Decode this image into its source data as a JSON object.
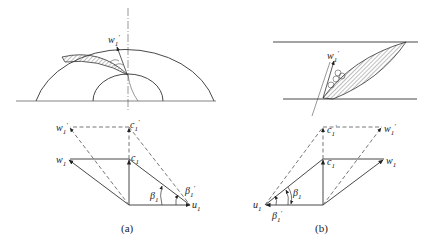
{
  "figure": {
    "panels": [
      {
        "id": "a",
        "caption": "(a)",
        "top_view": "Centrifugal impeller inlet (meridional half-disc) with blade and relative velocity arrow",
        "blade_label": {
          "sym": "w",
          "sub": "1",
          "sup": "′"
        },
        "labels": {
          "w1_prime": {
            "sym": "w",
            "sub": "1",
            "sup": "′"
          },
          "c1_prime": {
            "sym": "c",
            "sub": "1",
            "sup": "′"
          },
          "w1": {
            "sym": "w",
            "sub": "1"
          },
          "c1": {
            "sym": "c",
            "sub": "1"
          },
          "beta1": {
            "sym": "β",
            "sub": "1"
          },
          "beta1_prime": {
            "sym": "β",
            "sub": "1",
            "sup": "′"
          },
          "u1": {
            "sym": "u",
            "sub": "1"
          }
        }
      },
      {
        "id": "b",
        "caption": "(b)",
        "top_view": "Axial cascade blade between two parallel lines with relative velocity arrow",
        "blade_label": {
          "sym": "w",
          "sub": "1",
          "sup": "′"
        },
        "labels": {
          "c1_prime": {
            "sym": "c",
            "sub": "1",
            "sup": "′"
          },
          "w1_prime": {
            "sym": "w",
            "sub": "1",
            "sup": "′"
          },
          "c1": {
            "sym": "c",
            "sub": "1"
          },
          "w1": {
            "sym": "w",
            "sub": "1"
          },
          "beta1": {
            "sym": "β",
            "sub": "1"
          },
          "u1": {
            "sym": "u",
            "sub": "1"
          },
          "beta1_prime": {
            "sym": "β",
            "sub": "1",
            "sup": "′"
          }
        }
      }
    ],
    "colors": {
      "line": "#333333",
      "dashed": "#555555",
      "hatch": "#444444"
    }
  }
}
